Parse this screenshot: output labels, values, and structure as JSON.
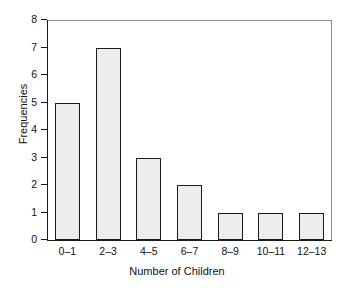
{
  "chart_data": {
    "type": "bar",
    "title": "",
    "xlabel": "Number of Children",
    "ylabel": "Frequencies",
    "categories": [
      "0–1",
      "2–3",
      "4–5",
      "6–7",
      "8–9",
      "10–11",
      "12–13"
    ],
    "values": [
      5,
      7,
      3,
      2,
      1,
      1,
      1
    ],
    "ylim": [
      0,
      8
    ],
    "yticks": [
      "0",
      "1",
      "2",
      "3",
      "4",
      "5",
      "6",
      "7",
      "8"
    ],
    "ytick_values": [
      0,
      1,
      2,
      3,
      4,
      5,
      6,
      7,
      8
    ],
    "grid": false,
    "legend": null,
    "colors": {
      "bar_fill": "#ededed",
      "bar_edge": "#1b1b1b",
      "axis": "#1b1b1b",
      "frame": "#8d8d8d",
      "background": "#ffffff",
      "text": "#111111"
    }
  }
}
